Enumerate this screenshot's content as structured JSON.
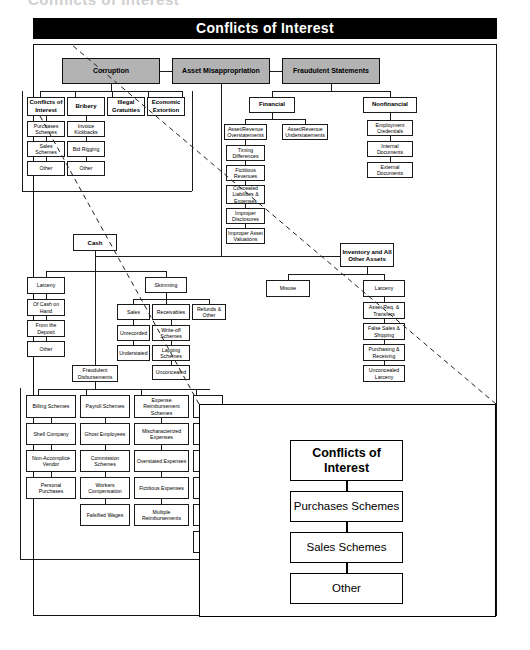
{
  "page": {
    "cut_heading": "Conflicts of Interest",
    "banner_title": "Conflicts of Interest"
  },
  "tree": {
    "level1": [
      {
        "label": "Corruption"
      },
      {
        "label": "Asset Misappropriation"
      },
      {
        "label": "Fraudulent Statements"
      }
    ],
    "corruption": {
      "children": [
        {
          "label": "Conflicts of Interest",
          "sub": [
            "Purchases Schemes",
            "Sales Schemes",
            "Other"
          ]
        },
        {
          "label": "Bribery",
          "sub": [
            "Invoice Kickbacks",
            "Bid Rigging",
            "Other"
          ]
        },
        {
          "label": "Illegal Gratuities",
          "sub": []
        },
        {
          "label": "Economic Extortion",
          "sub": []
        }
      ]
    },
    "fraudulent_statements": {
      "children": [
        {
          "label": "Financial",
          "sub": [
            {
              "label": "Asset/Revenue Overstatements",
              "chain": [
                "Timing Differences",
                "Fictitious Revenues",
                "Concealed Liabilities & Expenses",
                "Improper Disclosures",
                "Improper Asset Valuations"
              ]
            },
            {
              "label": "Asset/Revenue Understatements",
              "chain": []
            }
          ]
        },
        {
          "label": "Nonfinancial",
          "sub": [
            {
              "label": "Employment Credentials",
              "chain": []
            },
            {
              "label": "Internal Documents",
              "chain": []
            },
            {
              "label": "External Documents",
              "chain": []
            }
          ]
        }
      ]
    },
    "asset_misappropriation": {
      "cash": {
        "label": "Cash",
        "children": [
          {
            "label": "Larceny",
            "sub": [
              "Of Cash on Hand",
              "From the Deposit",
              "Other"
            ]
          },
          {
            "label": "Skimming",
            "columns": [
              {
                "label": "Sales",
                "sub": [
                  "Unrecorded",
                  "Understated"
                ]
              },
              {
                "label": "Receivables",
                "sub": [
                  "Write-off Schemes",
                  "Lapping Schemes",
                  "Unconcealed"
                ]
              },
              {
                "label": "Refunds & Other",
                "sub": []
              }
            ]
          },
          {
            "label": "Fraudulent Disbursements",
            "columns": [
              {
                "label": "Billing Schemes",
                "sub": [
                  "Shell Company",
                  "Non-Accomplice Vendor",
                  "Personal Purchases"
                ]
              },
              {
                "label": "Payroll Schemes",
                "sub": [
                  "Ghost Employees",
                  "Commission Schemes",
                  "Workers Compensation",
                  "Falsified Wages"
                ]
              },
              {
                "label": "Expense Reimbursement Schemes",
                "sub": [
                  "Mischaracterized Expenses",
                  "Overstated Expenses",
                  "Fictitious Expenses",
                  "Multiple Reimbursements"
                ]
              },
              {
                "label": "",
                "sub": [
                  "",
                  "",
                  "",
                  "",
                  ""
                ]
              }
            ]
          }
        ]
      },
      "inventory": {
        "label": "Inventory and All Other Assets",
        "children": [
          {
            "label": "Misuse",
            "sub": []
          },
          {
            "label": "Larceny",
            "sub": [
              "Asset Req. & Transfers",
              "False Sales & Shipping",
              "Purchasing & Receiving",
              "Unconcealed Larceny"
            ]
          }
        ]
      }
    }
  },
  "callout": {
    "header": "Conflicts of Interest",
    "items": [
      "Purchases Schemes",
      "Sales Schemes",
      "Other"
    ]
  },
  "colors": {
    "banner_bg": "#000000",
    "banner_text": "#ffffff",
    "level1_fill": "#b3b3b3",
    "box_border": "#1a1a1a",
    "page_bg": "#ffffff"
  }
}
